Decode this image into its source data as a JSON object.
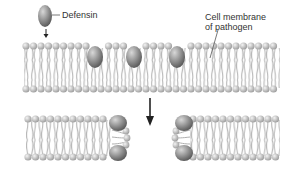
{
  "labels": {
    "defensin": "Defensin",
    "membrane_line1": "Cell membrane",
    "membrane_line2": "of pathogen"
  },
  "colors": {
    "head": "#c8c8c8",
    "tail": "#a9a9a9",
    "defensin": "#8a8a8a",
    "arrow": "#222222",
    "text": "#333333"
  }
}
